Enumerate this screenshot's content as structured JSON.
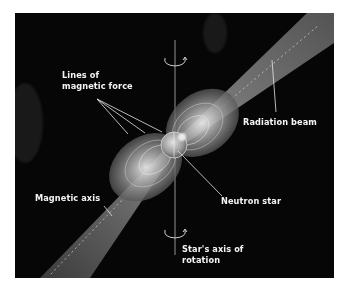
{
  "figure": {
    "colors": {
      "background": "#060606",
      "frame": "#ffffff",
      "beam": "#8a8a8a",
      "label_text": "#f4f4f4",
      "leader_line": "#e6e6e6"
    }
  },
  "labels": {
    "lines_of_force": {
      "line1": "Lines of",
      "line2": "magnetic force"
    },
    "radiation_beam": "Radiation beam",
    "magnetic_axis": "Magnetic axis",
    "neutron_star": "Neutron star",
    "rotation_axis": {
      "line1": "Star's axis of",
      "line2": "rotation"
    }
  },
  "icons": {
    "rotation_arrow_top": "curved-rotation-arrow",
    "rotation_arrow_bottom": "curved-rotation-arrow"
  }
}
